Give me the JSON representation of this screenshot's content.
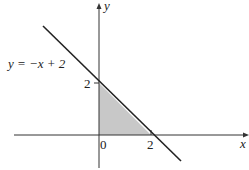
{
  "figure": {
    "equation_label": "y = −x + 2",
    "x_axis_label": "x",
    "y_axis_label": "y",
    "origin_label": "0",
    "x_intercept_label": "2",
    "y_intercept_label": "2"
  },
  "colors": {
    "line": "#222222",
    "axes": "#333333",
    "shade": "#c8c8c8",
    "background": "#ffffff"
  },
  "geometry": {
    "line": {
      "slope": -1,
      "intercept": 2
    },
    "shaded_region": [
      [
        0,
        0
      ],
      [
        0,
        2
      ],
      [
        2,
        0
      ]
    ]
  }
}
